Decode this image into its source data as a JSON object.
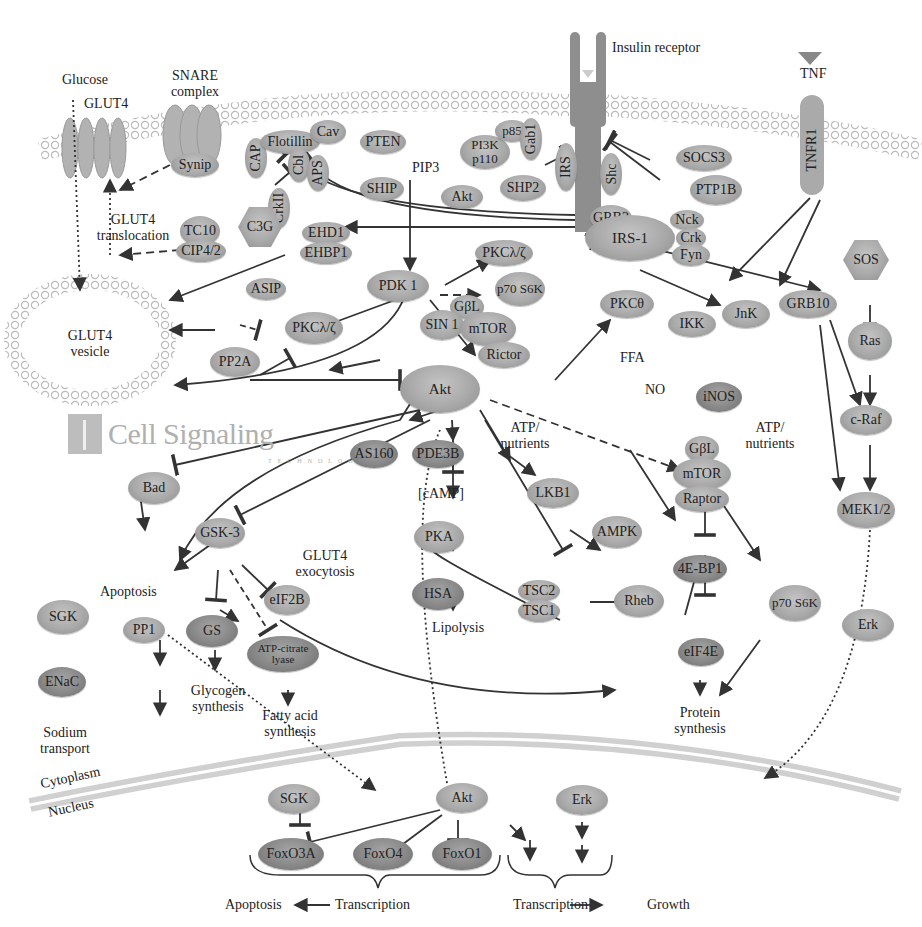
{
  "logo": {
    "name": "Cell Signaling",
    "sub": "TECHNOLOGY"
  },
  "labels": {
    "glucose": "Glucose",
    "glut4": "GLUT4",
    "snare": "SNARE complex",
    "insulin_receptor": "Insulin receptor",
    "tnf": "TNF",
    "glut4_translocation": "GLUT4 translocation",
    "glut4_vesicle": "GLUT4 vesicle",
    "pip3": "PIP3",
    "ffa": "FFA",
    "no": "NO",
    "atp_nutrients_1": "ATP/ nutrients",
    "atp_nutrients_2": "ATP/ nutrients",
    "camp": "[cAMP]",
    "glut4_exocytosis": "GLUT4 exocytosis",
    "apoptosis_1": "Apoptosis",
    "glycogen_synthesis": "Glycogen synthesis",
    "fatty_acid_synthesis": "Fatty acid synthesis",
    "lipolysis": "Lipolysis",
    "protein_synthesis": "Protein synthesis",
    "sodium_transport": "Sodium transport",
    "cytoplasm": "Cytoplasm",
    "nucleus": "Nucleus",
    "apoptosis_2": "Apoptosis",
    "transcription_1": "Transcription",
    "transcription_2": "Transcription",
    "growth": "Growth"
  },
  "nodes": {
    "synip": "Synip",
    "cap": "CAP",
    "flotillin": "Flotillin",
    "cav": "Cav",
    "cbl": "Cbl",
    "aps": "APS",
    "crkii": "CrkII",
    "c3g": "C3G",
    "tc10": "TC10",
    "cip4": "CIP4/2",
    "pten": "PTEN",
    "ship": "SHIP",
    "akt_top": "Akt",
    "pi3k": "PI3K p110",
    "p85": "p85",
    "gab1": "Gab1",
    "irs": "IRS",
    "shc": "Shc",
    "shp2": "SHP2",
    "socs3": "SOCS3",
    "ptp1b": "PTP1B",
    "tnfr1": "TNFR1",
    "ehd1": "EHD1",
    "ehbp1": "EHBP1",
    "grb2": "GRB2",
    "irs1": "IRS-1",
    "nck": "Nck",
    "crk": "Crk",
    "fyn": "Fyn",
    "sos": "SOS",
    "pkclz_top": "PKCλ/ζ",
    "p70s6k_top": "p70 S6K",
    "pdk1": "PDK 1",
    "asip": "ASIP",
    "pkclz_left": "PKCλ/ζ",
    "pp2a": "PP2A",
    "gbl_top": "GβL",
    "sin1": "SIN 1",
    "mtor_top": "mTOR",
    "rictor": "Rictor",
    "pkctheta": "PKCθ",
    "ikk": "IKK",
    "jnk": "JnK",
    "grb10": "GRB10",
    "ras": "Ras",
    "inos": "iNOS",
    "akt": "Akt",
    "craf": "c-Raf",
    "gbl": "GβL",
    "mtor": "mTOR",
    "raptor": "Raptor",
    "mek": "MEK1/2",
    "bad": "Bad",
    "as160": "AS160",
    "pde3b": "PDE3B",
    "lkb1": "LKB1",
    "ampk": "AMPK",
    "gsk3": "GSK-3",
    "pka": "PKA",
    "hsa": "HSA",
    "tsc2": "TSC2",
    "tsc1": "TSC1",
    "rheb": "Rheb",
    "4ebp1": "4E-BP1",
    "p70s6k": "p70 S6K",
    "erk": "Erk",
    "sgk": "SGK",
    "pp1": "PP1",
    "gs": "GS",
    "eif2b": "eIF2B",
    "atpcl": "ATP-citrate lyase",
    "enac": "ENaC",
    "eif4e": "eIF4E",
    "sgk_n": "SGK",
    "akt_n": "Akt",
    "erk_n": "Erk",
    "foxo3a": "FoxO3A",
    "foxo4": "FoxO4",
    "foxo1": "FoxO1"
  },
  "colors": {
    "node": "#a9a9a9",
    "node_dark": "#888888",
    "line": "#3a3a3a",
    "membrane": "#c8c8c8"
  }
}
